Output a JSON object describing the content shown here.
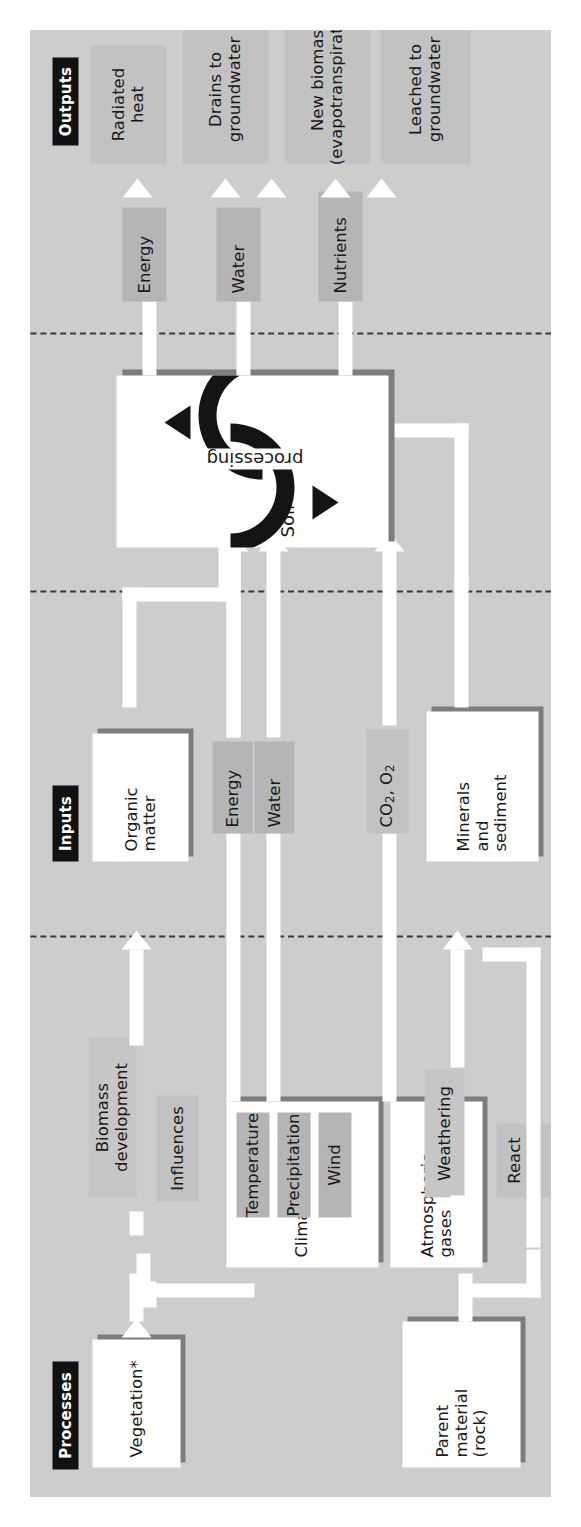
{
  "figure": {
    "background_color": "#cdcdcd",
    "accent_color": "#111111",
    "box_color": "#ffffff",
    "shadow_color": "#7d7d7d",
    "band_color": "#b5b5b5"
  },
  "sections": [
    {
      "id": "processes",
      "label": "Processes"
    },
    {
      "id": "inputs",
      "label": "Inputs"
    },
    {
      "id": "outputs",
      "label": "Outputs"
    }
  ],
  "processes": {
    "header": "Processes",
    "boxes": [
      {
        "name": "vegetation",
        "label": "Vegetation*",
        "style": "white"
      },
      {
        "name": "parent-material",
        "label": "Parent\nmaterial\n(rock)",
        "style": "white"
      },
      {
        "name": "climate",
        "label": "Climate",
        "style": "white"
      },
      {
        "name": "atmospheric-gases",
        "label": "Atmospheric\ngases",
        "style": "white"
      }
    ],
    "climate_items": [
      {
        "label": "Temperature"
      },
      {
        "label": "Precipitation"
      },
      {
        "label": "Wind"
      }
    ],
    "connector_labels": [
      {
        "name": "biomass-development",
        "label": "Biomass\ndevelopment"
      },
      {
        "name": "weathering",
        "label": "Weathering"
      },
      {
        "name": "influences",
        "label": "Influences"
      },
      {
        "name": "react-with",
        "label": "React\nwith"
      }
    ]
  },
  "inputs": {
    "header": "Inputs",
    "items": [
      {
        "name": "organic-matter",
        "label": "Organic\nmatter",
        "style": "white"
      },
      {
        "name": "energy",
        "label": "Energy",
        "style": "band"
      },
      {
        "name": "water",
        "label": "Water",
        "style": "band"
      },
      {
        "name": "gases",
        "label": "CO2, O2",
        "label_html": "CO<sub>2</sub>, O<sub>2</sub>",
        "style": "band"
      },
      {
        "name": "minerals-and-sediment",
        "label": "Minerals\nand\nsediment",
        "style": "white"
      }
    ]
  },
  "core": {
    "name": "soil-processing",
    "label_primary": "Soil",
    "label_secondary": "processing",
    "icon": "cycle-arrows-icon"
  },
  "outputs": {
    "header": "Outputs",
    "stores": [
      {
        "name": "energy",
        "label": "Energy"
      },
      {
        "name": "water",
        "label": "Water"
      },
      {
        "name": "nutrients",
        "label": "Nutrients"
      }
    ],
    "items": [
      {
        "name": "radiated-heat",
        "label": "Radiated\nheat"
      },
      {
        "name": "drains-to-groundwater",
        "label": "Drains to\ngroundwater"
      },
      {
        "name": "new-biomass",
        "label": "New biomas\n(evapotranspiration)"
      },
      {
        "name": "leached-to-groundwater",
        "label": "Leached to\ngroundwater"
      }
    ]
  }
}
